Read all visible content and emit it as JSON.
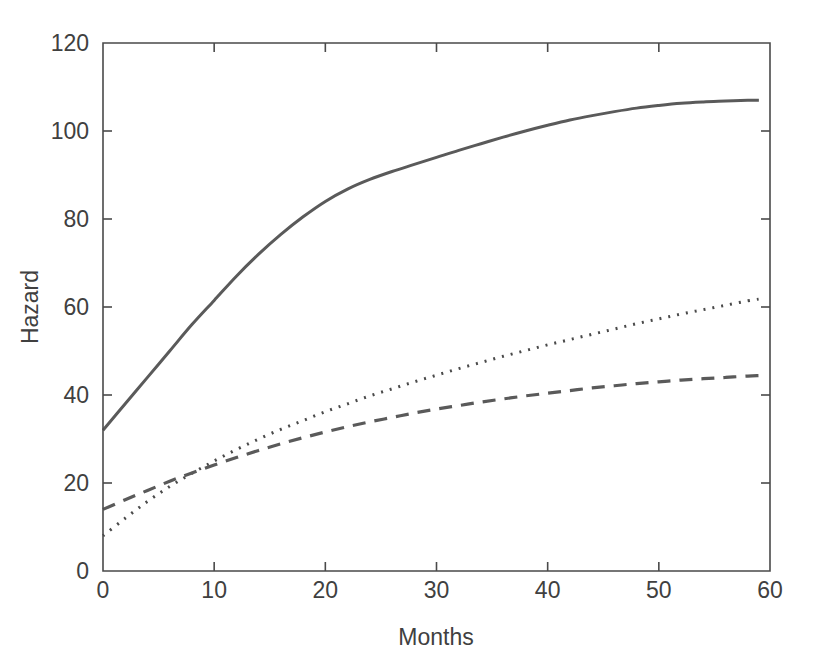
{
  "figure": {
    "background_color": "#ffffff",
    "axis_color": "#4a4a4a",
    "text_color": "#404040"
  },
  "chart_data": {
    "type": "line",
    "title": "",
    "xlabel": "Months",
    "ylabel": "Hazard",
    "xlim": [
      0,
      60
    ],
    "ylim": [
      0,
      120
    ],
    "xticks": [
      0,
      10,
      20,
      30,
      40,
      50,
      60
    ],
    "yticks": [
      0,
      20,
      40,
      60,
      80,
      100,
      120
    ],
    "xtick_labels": [
      "0",
      "10",
      "20",
      "30",
      "40",
      "50",
      "60"
    ],
    "ytick_labels": [
      "0",
      "20",
      "40",
      "60",
      "80",
      "100",
      "120"
    ],
    "grid": false,
    "legend": "none",
    "x": [
      0,
      2,
      4,
      6,
      8,
      10,
      12,
      14,
      16,
      18,
      20,
      22,
      24,
      26,
      28,
      30,
      32,
      34,
      36,
      38,
      40,
      42,
      44,
      46,
      48,
      50,
      52,
      54,
      56,
      58,
      59
    ],
    "series": [
      {
        "name": "solid-curve",
        "style": "solid",
        "color": "#5a5a5a",
        "width": 3.0,
        "dash": "none",
        "values": [
          32.0,
          38.0,
          44.0,
          50.0,
          56.0,
          61.5,
          67.0,
          72.0,
          76.5,
          80.5,
          84.0,
          86.8,
          89.0,
          90.8,
          92.4,
          94.0,
          95.6,
          97.1,
          98.6,
          100.0,
          101.3,
          102.5,
          103.5,
          104.4,
          105.2,
          105.8,
          106.3,
          106.6,
          106.8,
          107.0,
          107.0
        ]
      },
      {
        "name": "dotted-curve",
        "style": "dotted",
        "color": "#4a4a4a",
        "width": 3.0,
        "dash": "2,7",
        "values": [
          8.0,
          12.0,
          15.8,
          19.2,
          22.2,
          25.0,
          27.6,
          30.0,
          32.2,
          34.2,
          36.2,
          38.0,
          39.8,
          41.4,
          43.0,
          44.5,
          46.0,
          47.4,
          48.8,
          50.1,
          51.4,
          52.6,
          53.8,
          55.0,
          56.2,
          57.3,
          58.4,
          59.4,
          60.4,
          61.4,
          61.8
        ]
      },
      {
        "name": "dashed-curve",
        "style": "dashed",
        "color": "#5a5a5a",
        "width": 3.2,
        "dash": "13,9",
        "values": [
          14.0,
          16.2,
          18.3,
          20.4,
          22.3,
          24.1,
          25.8,
          27.4,
          28.9,
          30.3,
          31.6,
          32.8,
          33.9,
          34.9,
          35.9,
          36.8,
          37.6,
          38.4,
          39.1,
          39.8,
          40.4,
          41.0,
          41.6,
          42.1,
          42.6,
          43.0,
          43.4,
          43.7,
          44.0,
          44.3,
          44.4
        ]
      }
    ]
  }
}
